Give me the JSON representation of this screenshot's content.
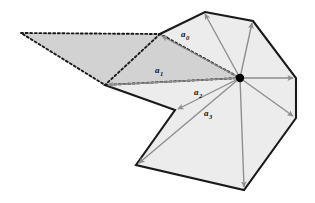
{
  "figure": {
    "canvas": {
      "width": 315,
      "height": 203,
      "background": "#ffffff"
    }
  },
  "colors": {
    "polygon_fill": "#ececec",
    "polygon_stroke": "#1a1a1a",
    "wedge_fill": "#d2d2d2",
    "wedge_stroke": "#1a1a1a",
    "arrow": "#8d8d8d",
    "hub_dot": "#000000",
    "label_text": "#111111"
  },
  "kernel_point": {
    "name": "kernel-hub",
    "x": 240,
    "y": 78,
    "radius": 4.2
  },
  "polygon": {
    "name": "star-shaped-polygon",
    "stroke_width": 2.1,
    "vertices": [
      {
        "id": "v0",
        "x": 205,
        "y": 12
      },
      {
        "id": "v1",
        "x": 253,
        "y": 21
      },
      {
        "id": "v2",
        "x": 296,
        "y": 78
      },
      {
        "id": "v3",
        "x": 296,
        "y": 118
      },
      {
        "id": "v4",
        "x": 244,
        "y": 190
      },
      {
        "id": "v5",
        "x": 136,
        "y": 165
      },
      {
        "id": "v6",
        "x": 175,
        "y": 110
      },
      {
        "id": "v7",
        "x": 105,
        "y": 85
      },
      {
        "id": "v8",
        "x": 160,
        "y": 34
      }
    ]
  },
  "wedge": {
    "name": "dotted-visibility-wedge",
    "fill": "#d2d2d2",
    "dash_pattern": "2,2.6",
    "stroke_width": 1.9,
    "vertices": [
      {
        "id": "w0",
        "x": 21,
        "y": 33
      },
      {
        "id": "w1",
        "x": 160,
        "y": 34
      },
      {
        "id": "w2",
        "x": 240,
        "y": 78
      },
      {
        "id": "w3",
        "x": 105,
        "y": 85
      }
    ],
    "inner_edges": [
      {
        "from": {
          "x": 160,
          "y": 34
        },
        "to": {
          "x": 105,
          "y": 85
        }
      }
    ]
  },
  "arrows": [
    {
      "id": "a-v0",
      "name": "arrow-to-v0",
      "from": {
        "x": 240,
        "y": 78
      },
      "to": {
        "x": 205,
        "y": 14
      }
    },
    {
      "id": "a-v1",
      "name": "arrow-to-v1",
      "from": {
        "x": 240,
        "y": 78
      },
      "to": {
        "x": 252,
        "y": 23
      }
    },
    {
      "id": "a-v2",
      "name": "arrow-to-v2",
      "from": {
        "x": 240,
        "y": 78
      },
      "to": {
        "x": 293,
        "y": 78
      }
    },
    {
      "id": "a-v3",
      "name": "arrow-to-v3",
      "from": {
        "x": 240,
        "y": 78
      },
      "to": {
        "x": 293,
        "y": 116
      }
    },
    {
      "id": "a-v4",
      "name": "arrow-to-v4",
      "from": {
        "x": 240,
        "y": 78
      },
      "to": {
        "x": 244,
        "y": 187
      }
    },
    {
      "id": "a-v5",
      "name": "arrow-to-v5",
      "from": {
        "x": 240,
        "y": 78
      },
      "to": {
        "x": 139,
        "y": 163
      }
    },
    {
      "id": "a-v6",
      "name": "arrow-to-v6",
      "from": {
        "x": 240,
        "y": 78
      },
      "to": {
        "x": 178,
        "y": 109
      }
    },
    {
      "id": "a-v7",
      "name": "arrow-to-v7",
      "from": {
        "x": 240,
        "y": 78
      },
      "to": {
        "x": 108,
        "y": 85
      }
    },
    {
      "id": "a-v8",
      "name": "arrow-to-v8",
      "from": {
        "x": 240,
        "y": 78
      },
      "to": {
        "x": 162,
        "y": 36
      }
    }
  ],
  "labels": [
    {
      "id": "a0",
      "name": "vector-label-a0",
      "base": "a",
      "sub": "0",
      "x": 181,
      "y": 37
    },
    {
      "id": "a1",
      "name": "vector-label-a1",
      "base": "a",
      "sub": "1",
      "x": 155,
      "y": 73
    },
    {
      "id": "a2",
      "name": "vector-label-a2",
      "base": "a",
      "sub": "2",
      "x": 194,
      "y": 95
    },
    {
      "id": "a3",
      "name": "vector-label-a3",
      "base": "a",
      "sub": "3",
      "x": 204,
      "y": 116
    }
  ]
}
